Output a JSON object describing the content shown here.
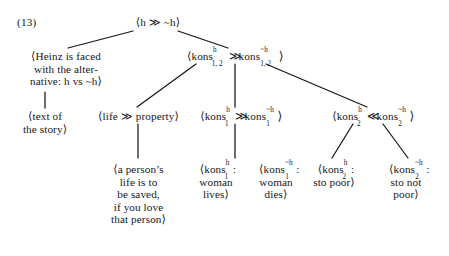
{
  "figure": {
    "example_number": "(13)",
    "angle_open": "⟨",
    "angle_close": "⟩",
    "much_greater": "≫",
    "much_less": "≪",
    "negation": "~",
    "ink_color": "#16161a",
    "background_color": "#ffffff"
  },
  "nodes": {
    "root": {
      "id": "root",
      "text": "⟨h ≫ ~h⟩",
      "base": "h",
      "operator": "≫",
      "right": "~h",
      "x": 128,
      "y": 17
    },
    "left_premise": {
      "id": "heinz-alternative",
      "lines": [
        "⟨Heinz is faced",
        "with the alter-",
        "native: h vs ~h⟩"
      ],
      "x": 8,
      "y": 50
    },
    "text_of_story": {
      "id": "text-of-the-story",
      "lines": [
        "⟨text of",
        "the story⟩"
      ],
      "x": 13,
      "y": 110
    },
    "kons12": {
      "id": "kons-1-2",
      "prefix": "⟨kons",
      "sup1": "h",
      "sub1": "1, 2",
      "operator": "≫",
      "word2": "kons",
      "sup2": "~h",
      "sub2": "1, 2",
      "suffix": "⟩",
      "x": 172,
      "y": 50
    },
    "life_property": {
      "id": "life-property",
      "text": "⟨life ≫ property⟩",
      "x": 90,
      "y": 110
    },
    "kons1": {
      "id": "kons-1",
      "prefix": "⟨kons",
      "sup1": "h",
      "sub1": "1",
      "operator": "≫",
      "word2": "kons",
      "sup2": "~h",
      "sub2": "1",
      "suffix": "⟩",
      "x": 198,
      "y": 110
    },
    "kons2": {
      "id": "kons-2",
      "prefix": "⟨kons",
      "sup1": "h",
      "sub1": "2",
      "operator": "≪",
      "word2": "kons",
      "sup2": "~h",
      "sub2": "2",
      "suffix": "⟩",
      "x": 330,
      "y": 110
    },
    "person_life": {
      "id": "a-persons-life",
      "lines": [
        "⟨a person’s",
        "life is to",
        "be saved,",
        "if you love",
        "that person⟩"
      ],
      "x": 97,
      "y": 163
    },
    "kons1_h_leaf": {
      "id": "kons-1-h-woman-lives",
      "prefix": "⟨kons",
      "sup": "h",
      "sub": "1",
      "colon": ":",
      "lines": [
        "woman",
        "lives⟩"
      ],
      "x": 185,
      "y": 163
    },
    "kons1_nh_leaf": {
      "id": "kons-1-not-h-woman-dies",
      "prefix": "⟨kons",
      "sup": "~h",
      "sub": "1",
      "colon": ":",
      "lines": [
        "woman",
        "dies⟩"
      ],
      "x": 243,
      "y": 163
    },
    "kons2_h_leaf": {
      "id": "kons-2-h-sto-poor",
      "prefix": "⟨kons",
      "sup": "h",
      "sub": "2",
      "colon": ":",
      "lines": [
        "sto poor⟩"
      ],
      "x": 315,
      "y": 163
    },
    "kons2_nh_leaf": {
      "id": "kons-2-not-h-sto-not-poor",
      "prefix": "⟨kons",
      "sup": "~h",
      "sub": "2",
      "colon": ":",
      "lines": [
        "sto not",
        "poor⟩"
      ],
      "x": 380,
      "y": 163
    }
  },
  "edges": [
    {
      "name": "root-to-heinz",
      "x1": 133,
      "y1": 31,
      "x2": 68,
      "y2": 48
    },
    {
      "name": "root-to-kons12",
      "x1": 178,
      "y1": 31,
      "x2": 228,
      "y2": 48
    },
    {
      "name": "heinz-to-text",
      "x1": 45,
      "y1": 92,
      "x2": 45,
      "y2": 108
    },
    {
      "name": "kons12-to-life-property",
      "x1": 196,
      "y1": 64,
      "x2": 137,
      "y2": 108
    },
    {
      "name": "kons12-to-kons1",
      "x1": 235,
      "y1": 64,
      "x2": 235,
      "y2": 108
    },
    {
      "name": "kons12-to-kons2",
      "x1": 266,
      "y1": 64,
      "x2": 367,
      "y2": 108
    },
    {
      "name": "life-property-to-person",
      "x1": 138,
      "y1": 124,
      "x2": 138,
      "y2": 160
    },
    {
      "name": "kons1-to-leaf",
      "x1": 235,
      "y1": 124,
      "x2": 235,
      "y2": 160
    },
    {
      "name": "kons2-to-poor",
      "x1": 353,
      "y1": 124,
      "x2": 332,
      "y2": 160
    },
    {
      "name": "kons2-to-not-poor",
      "x1": 383,
      "y1": 124,
      "x2": 408,
      "y2": 160
    }
  ]
}
